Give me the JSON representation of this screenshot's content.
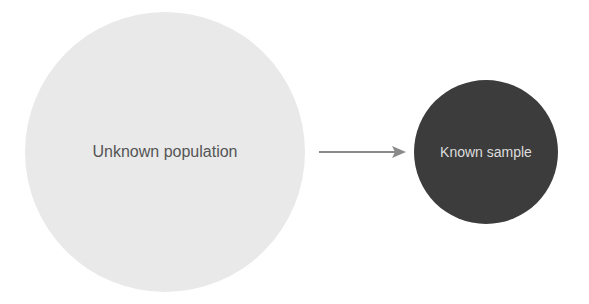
{
  "diagram": {
    "nodes": [
      {
        "id": "population",
        "label": "Unknown population",
        "fill": "#e9e9e9",
        "text_color": "#555555"
      },
      {
        "id": "sample",
        "label": "Known sample",
        "fill": "#3c3c3c",
        "text_color": "#dddddd"
      }
    ],
    "edges": [
      {
        "from": "population",
        "to": "sample",
        "color": "#888888"
      }
    ]
  }
}
